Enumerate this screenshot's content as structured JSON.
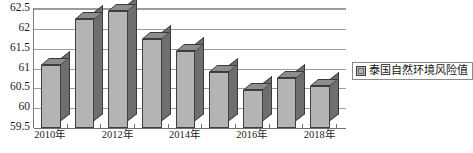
{
  "chart_data": {
    "type": "bar",
    "title": "",
    "xlabel": "",
    "ylabel": "",
    "ylim": [
      59.5,
      62.5
    ],
    "ytick_labels": [
      "62.5",
      "62",
      "61.5",
      "61",
      "60.5",
      "60",
      "59.5"
    ],
    "yticks": [
      62.5,
      62.0,
      61.5,
      61.0,
      60.5,
      60.0,
      59.5
    ],
    "grid": true,
    "legend_position": "right",
    "categories": [
      "2010年",
      "2011年",
      "2012年",
      "2013年",
      "2014年",
      "2015年",
      "2016年",
      "2017年",
      "2018年"
    ],
    "visible_xtick_labels": [
      "2010年",
      "",
      "2012年",
      "",
      "2014年",
      "",
      "2016年",
      "",
      "2018年"
    ],
    "series": [
      {
        "name": "泰国自然环境风险值",
        "values": [
          61.1,
          62.25,
          62.45,
          61.75,
          61.45,
          60.9,
          60.45,
          60.75,
          60.55
        ]
      }
    ]
  },
  "legend": {
    "entries": [
      {
        "label": "泰国自然环境风险值",
        "swatch_color": "#b4b4b4"
      }
    ]
  },
  "colors": {
    "bar_front": "#b4b4b4",
    "bar_side": "#6e6e6e",
    "bar_top": "#8d8d8d",
    "gridline": "#9d9d9d",
    "axis": "#6f6f6f",
    "text": "#1c1c1c",
    "background": "#ffffff"
  }
}
